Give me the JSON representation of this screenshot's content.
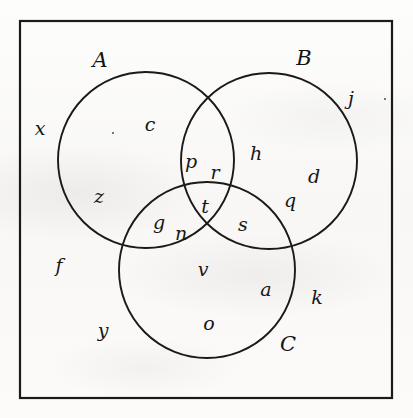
{
  "figure": {
    "type": "venn-diagram-3-set",
    "stroke_color": "#1a1a1a",
    "background_color": "#fbfbfa",
    "universe_box": {
      "x": 20,
      "y": 21,
      "width": 372,
      "height": 377
    },
    "circles": [
      {
        "name": "A",
        "cx": 146,
        "cy": 160,
        "r": 88
      },
      {
        "name": "B",
        "cx": 269,
        "cy": 161,
        "r": 88
      },
      {
        "name": "C",
        "cx": 207,
        "cy": 270,
        "r": 88
      }
    ]
  },
  "set_labels": [
    {
      "text": "A",
      "x": 100,
      "y": 60,
      "region": "circle-a-title"
    },
    {
      "text": "B",
      "x": 304,
      "y": 58,
      "region": "circle-b-title"
    },
    {
      "text": "C",
      "x": 288,
      "y": 344,
      "region": "circle-c-title"
    }
  ],
  "elements": [
    {
      "text": "x",
      "x": 40,
      "y": 128,
      "region": "outside-all"
    },
    {
      "text": "c",
      "x": 150,
      "y": 124,
      "region": "A-only"
    },
    {
      "text": "z",
      "x": 99,
      "y": 196,
      "region": "A-only"
    },
    {
      "text": "f",
      "x": 59,
      "y": 265,
      "region": "outside-all"
    },
    {
      "text": "y",
      "x": 103,
      "y": 330,
      "region": "outside-all"
    },
    {
      "text": "j",
      "x": 351,
      "y": 98,
      "region": "outside-all"
    },
    {
      "text": "h",
      "x": 256,
      "y": 153,
      "region": "B-only"
    },
    {
      "text": "d",
      "x": 314,
      "y": 176,
      "region": "B-only"
    },
    {
      "text": "q",
      "x": 290,
      "y": 200,
      "region": "B-only"
    },
    {
      "text": "k",
      "x": 317,
      "y": 297,
      "region": "outside-all"
    },
    {
      "text": "p",
      "x": 191,
      "y": 161,
      "region": "A-and-B"
    },
    {
      "text": "r",
      "x": 215,
      "y": 172,
      "region": "A-and-B"
    },
    {
      "text": "g",
      "x": 159,
      "y": 222,
      "region": "A-and-C"
    },
    {
      "text": "n",
      "x": 181,
      "y": 233,
      "region": "A-and-C"
    },
    {
      "text": "t",
      "x": 205,
      "y": 206,
      "region": "A-and-B-and-C"
    },
    {
      "text": "s",
      "x": 243,
      "y": 224,
      "region": "B-and-C"
    },
    {
      "text": "v",
      "x": 203,
      "y": 269,
      "region": "C-only"
    },
    {
      "text": "a",
      "x": 266,
      "y": 289,
      "region": "C-only"
    },
    {
      "text": "o",
      "x": 209,
      "y": 323,
      "region": "C-only"
    }
  ],
  "stray_marks": [
    {
      "x": 113,
      "y": 133
    },
    {
      "x": 385,
      "y": 99
    }
  ]
}
